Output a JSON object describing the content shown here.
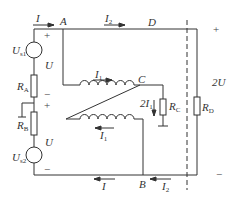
{
  "diagram": {
    "type": "circuit",
    "nodes": {
      "A": "A",
      "B": "B",
      "C": "C",
      "D": "D"
    },
    "currents": {
      "I_top": {
        "sym": "I",
        "sub": ""
      },
      "I2_top": {
        "sym": "I",
        "sub": "2"
      },
      "I1_top": {
        "sym": "I",
        "sub": "1"
      },
      "I1_bottom": {
        "sym": "I",
        "sub": "1"
      },
      "I_bottom": {
        "sym": "I",
        "sub": ""
      },
      "I2_bottom": {
        "sym": "I",
        "sub": "2"
      },
      "RC_current": {
        "sym": "2I",
        "sub": "1"
      }
    },
    "sources": {
      "Us1": {
        "sym": "U",
        "sub": "s1"
      },
      "Us2": {
        "sym": "U",
        "sub": "s2"
      }
    },
    "resistors": {
      "RA": {
        "sym": "R",
        "sub": "A"
      },
      "RB": {
        "sym": "R",
        "sub": "B"
      },
      "RC": {
        "sym": "R",
        "sub": "C"
      },
      "RD": {
        "sym": "R",
        "sub": "D"
      }
    },
    "voltages": {
      "U_upper": "U",
      "U_lower": "U",
      "U_right": "2U"
    },
    "signs": {
      "plus": "+",
      "minus": "−"
    },
    "colors": {
      "line": "#333333",
      "text": "#333333"
    }
  }
}
